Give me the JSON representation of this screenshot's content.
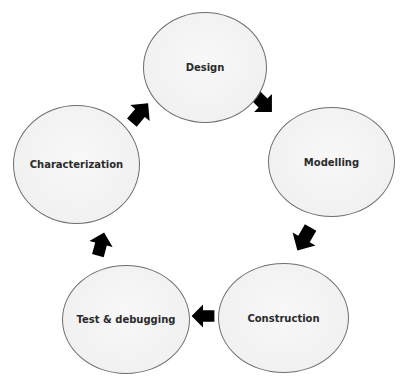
{
  "diagram": {
    "type": "cycle",
    "nodes": [
      {
        "id": "design",
        "label": "Design"
      },
      {
        "id": "modelling",
        "label": "Modelling"
      },
      {
        "id": "construction",
        "label": "Construction"
      },
      {
        "id": "test",
        "label": "Test & debugging"
      },
      {
        "id": "characterization",
        "label": "Characterization"
      }
    ],
    "edges": [
      {
        "from": "design",
        "to": "modelling"
      },
      {
        "from": "modelling",
        "to": "construction"
      },
      {
        "from": "construction",
        "to": "test"
      },
      {
        "from": "test",
        "to": "characterization"
      },
      {
        "from": "characterization",
        "to": "design"
      }
    ],
    "colors": {
      "background": "#ffffff",
      "node_fill": "#f3f3f3",
      "node_border": "#6e6e6e",
      "arrow": "#000000",
      "text": "#2a2a2a"
    }
  }
}
